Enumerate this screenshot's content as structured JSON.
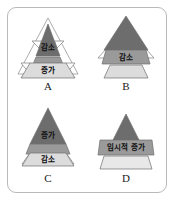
{
  "figure": {
    "frame_color": "#b9b9b9",
    "background": "#ffffff"
  },
  "palette": {
    "dark": "#6d6d6d",
    "medium": "#9a9a9a",
    "light": "#dcdcdc",
    "lighter": "#e8e8e8",
    "outline": "#6f6f6f",
    "text": "#111111",
    "letter": "#1a1a1a"
  },
  "panels": [
    {
      "id": "A",
      "letter": "A",
      "tiers": [
        {
          "name": "top",
          "label": "감소",
          "shade": "dark"
        },
        {
          "name": "middle",
          "label": "",
          "shade": "medium"
        },
        {
          "name": "bottom",
          "label": "증가",
          "shade": "light"
        }
      ],
      "wings": [
        "top",
        "bottom"
      ]
    },
    {
      "id": "B",
      "letter": "B",
      "tiers": [
        {
          "name": "top",
          "label": "",
          "shade": "dark"
        },
        {
          "name": "middle",
          "label": "감소",
          "shade": "medium"
        },
        {
          "name": "bottom",
          "label": "",
          "shade": "light"
        }
      ],
      "wings": [
        "middle"
      ]
    },
    {
      "id": "C",
      "letter": "C",
      "tiers": [
        {
          "name": "top",
          "label": "증가",
          "shade": "dark"
        },
        {
          "name": "middle",
          "label": "",
          "shade": "medium"
        },
        {
          "name": "bottom",
          "label": "감소",
          "shade": "light"
        }
      ],
      "wings": [
        "bottom"
      ]
    },
    {
      "id": "D",
      "letter": "D",
      "tiers": [
        {
          "name": "top",
          "label": "",
          "shade": "dark"
        },
        {
          "name": "middle",
          "label": "임시적 증가",
          "shade": "medium"
        },
        {
          "name": "bottom",
          "label": "",
          "shade": "lighter"
        }
      ],
      "wings": []
    }
  ]
}
